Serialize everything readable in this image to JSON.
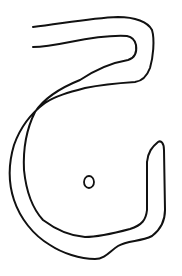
{
  "drawing": {
    "description": "hand-drawn closed outline shape resembling a hook / letter G with a small circle inside",
    "stroke_color": "#111111",
    "background_color": "#ffffff",
    "stroke_width": 2,
    "outline_path": "M33,27 C60,24 90,18 118,17 C135,17 148,22 152,30 C155,40 153,58 150,68 C147,76 143,81 135,82 C120,83 100,85 85,88 C70,92 55,96 45,103 C30,114 20,128 14,145 C8,165 9,185 14,200 C20,218 33,235 50,245 C62,253 80,259 95,259 C105,259 110,251 118,246 C128,240 140,242 152,236 C160,230 165,222 165,210 L164,150 C164,143 161,140 158,142 C152,147 148,152 147,162 L147,210 C146,220 142,225 130,229 C115,233 100,237 85,237 C70,236 55,229 43,220 C32,208 26,190 24,170 C23,150 26,130 35,112 C45,97 60,88 80,80 C95,70 110,63 128,60 C135,58 137,52 136,45 C135,40 132,37 127,36 C110,35 90,38 70,42 C55,45 45,47 33,47",
    "dot": {
      "cx": 89,
      "cy": 182,
      "rx": 5,
      "ry": 6
    }
  }
}
